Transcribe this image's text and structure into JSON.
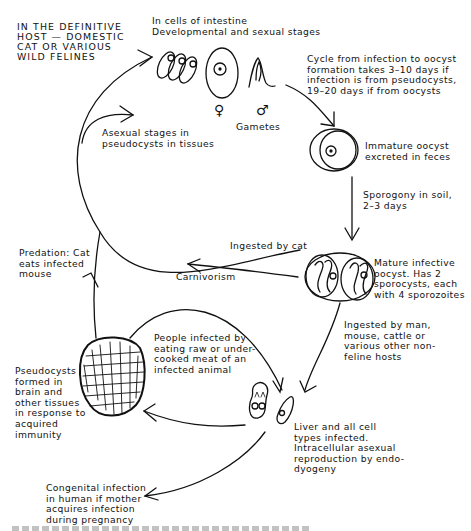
{
  "diagram": {
    "host_label": "IN THE DEFINITIVE\nHOST — DOMESTIC\nCAT OR VARIOUS\nWILD FELINES",
    "nodes": {
      "intestine": "In cells of intestine\nDevelopmental and sexual stages",
      "gametes": "Gametes",
      "female_symbol": "♀",
      "male_symbol": "♂",
      "cycle_time": "Cycle from infection to oocyst\nformation takes 3–10 days if\ninfection is from pseudocysts,\n19–20 days if from oocysts",
      "immature_oocyst": "Immature oocyst\nexcreted in feces",
      "sporogony": "Sporogony in soil,\n2–3 days",
      "ingested_by_cat": "Ingested by cat",
      "mature_oocyst": "Mature infective\noocyst.  Has 2\nsporocysts, each\nwith 4 sporozoites",
      "asexual_stages": "Asexual stages in\npseudocysts in tissues",
      "carnivorism": "Carnivorism",
      "predation": "Predation: Cat\neats infected\nmouse",
      "people_infected": "People infected by\neating raw or under-\ncooked meat of an\ninfected animal",
      "ingested_by_hosts": "Ingested by man,\nmouse, cattle or\nvarious other non-\nfeline hosts",
      "pseudocysts": "Pseudocysts\nformed in\nbrain and\nother tissues\nin response to\nacquired\nimmunity",
      "liver": "Liver and all cell\ntypes infected.\nIntracellular asexual\nreproduction by endo-\ndyogeny",
      "congenital": "Congenital infection\nin human if mother\nacquires infection\nduring pregnancy"
    },
    "colors": {
      "ink": "#111111",
      "background": "#ffffff"
    }
  }
}
